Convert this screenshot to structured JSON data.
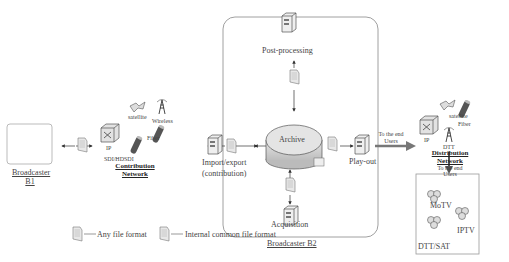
{
  "diagram": {
    "broadcaster_b1": {
      "line1": "Broadcaster",
      "line2": "B1"
    },
    "broadcaster_b2": {
      "label": "Broadcaster B2"
    },
    "contribution_network": {
      "title_line1": "Contribution",
      "title_line2": "Network",
      "ip": "IP",
      "satellite": "satellite",
      "wireless": "Wireless",
      "fiber": "Fiber",
      "sdi": "SDI/HDSDI"
    },
    "nodes": {
      "post_processing": "Post-processing",
      "archive": "Archive",
      "import_export_line1": "Import/export",
      "import_export_line2": "(contribution)",
      "play_out": "Play-out",
      "acquisition": "Acquisition"
    },
    "arrow_to_users": {
      "line1": "To the end",
      "line2": "Users"
    },
    "distribution_network": {
      "ip": "IP",
      "satellite": "satellite",
      "fiber": "Fiber",
      "dtt": "DTT",
      "title_line1": "Distribution",
      "title_line2": "Network",
      "to_users_line1": "To the end",
      "to_users_line2": "Users"
    },
    "end_users": {
      "motv": "MoTV",
      "iptv": "IPTV",
      "dtt_sat": "DTT/SAT"
    },
    "legend": {
      "any_file_format": "Any file format",
      "internal_common_file_format": "Internal common file format"
    }
  }
}
